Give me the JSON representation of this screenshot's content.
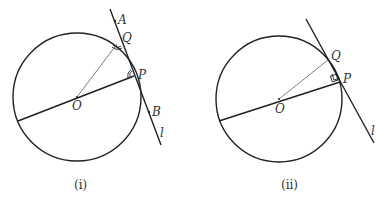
{
  "figures": [
    {
      "caption": "(i)",
      "labels": {
        "A": "A",
        "Q": "Q",
        "P": "P",
        "O": "O",
        "B": "B",
        "l": "l"
      },
      "marks": "equal-angle arcs at Q and P"
    },
    {
      "caption": "(ii)",
      "labels": {
        "Q": "Q",
        "P": "P",
        "O": "O",
        "l": "l"
      },
      "marks": "right-angle square at P"
    }
  ],
  "colors": {
    "stroke": "#222222",
    "text": "#333333",
    "background": "#ffffff"
  }
}
